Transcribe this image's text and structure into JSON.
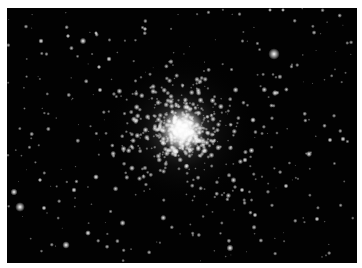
{
  "image": {
    "subject": "globular star cluster",
    "background_color": "#020202",
    "border_color": "#ffffff",
    "frame": {
      "x": 7,
      "y": 8,
      "width": 350,
      "height": 255
    },
    "core": {
      "x": 182,
      "y": 130,
      "radius": 22,
      "halo_radius": 75
    },
    "bright_stars": [
      {
        "x": 274,
        "y": 54,
        "r": 2.6
      },
      {
        "x": 20,
        "y": 207,
        "r": 2.2
      },
      {
        "x": 14,
        "y": 192,
        "r": 1.6
      },
      {
        "x": 66,
        "y": 245,
        "r": 1.7
      },
      {
        "x": 230,
        "y": 248,
        "r": 1.6
      },
      {
        "x": 83,
        "y": 41,
        "r": 1.5
      },
      {
        "x": 41,
        "y": 41,
        "r": 1.2
      },
      {
        "x": 275,
        "y": 93,
        "r": 1.4
      },
      {
        "x": 309,
        "y": 154,
        "r": 1.4
      },
      {
        "x": 253,
        "y": 120,
        "r": 1.3
      },
      {
        "x": 343,
        "y": 139,
        "r": 1.2
      },
      {
        "x": 330,
        "y": 140,
        "r": 1.1
      },
      {
        "x": 317,
        "y": 219,
        "r": 1.1
      },
      {
        "x": 74,
        "y": 190,
        "r": 1.2
      },
      {
        "x": 96,
        "y": 177,
        "r": 1.3
      },
      {
        "x": 44,
        "y": 208,
        "r": 1.1
      },
      {
        "x": 88,
        "y": 233,
        "r": 1.3
      },
      {
        "x": 109,
        "y": 59,
        "r": 1.2
      },
      {
        "x": 99,
        "y": 67,
        "r": 1.0
      },
      {
        "x": 100,
        "y": 90,
        "r": 1.1
      },
      {
        "x": 68,
        "y": 36,
        "r": 1.0
      },
      {
        "x": 145,
        "y": 29,
        "r": 1.0
      },
      {
        "x": 270,
        "y": 10,
        "r": 0.9
      },
      {
        "x": 283,
        "y": 10,
        "r": 0.9
      },
      {
        "x": 245,
        "y": 160,
        "r": 1.2
      },
      {
        "x": 255,
        "y": 215,
        "r": 1.1
      },
      {
        "x": 286,
        "y": 186,
        "r": 1.1
      },
      {
        "x": 242,
        "y": 190,
        "r": 1.1
      },
      {
        "x": 96,
        "y": 33,
        "r": 0.9
      },
      {
        "x": 40,
        "y": 180,
        "r": 1.0
      }
    ],
    "field_star_count": 260,
    "cluster_star_count": 520,
    "seed": 42
  }
}
